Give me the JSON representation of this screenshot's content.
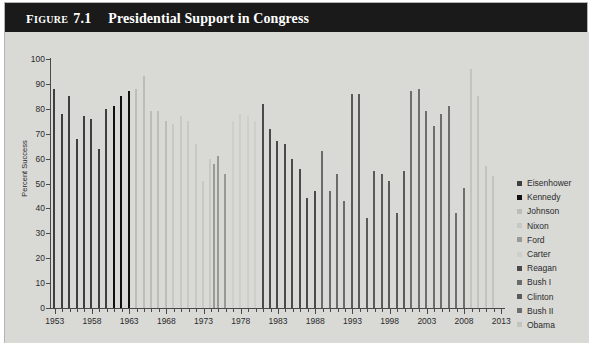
{
  "figure": {
    "label_prefix": "F",
    "label_rest": "IGURE",
    "number": "7.1",
    "title": "Presidential Support in Congress"
  },
  "chart_data": {
    "type": "bar",
    "title": "Presidential Support in Congress",
    "xlabel": "",
    "ylabel": "Percent Success",
    "ylim": [
      0,
      100
    ],
    "ytick_step": 10,
    "yticks": [
      0,
      10,
      20,
      30,
      40,
      50,
      60,
      70,
      80,
      90,
      100
    ],
    "grid": false,
    "legend_position": "right",
    "x_start_year": 1953,
    "x_end_year": 2013,
    "xticks_major": [
      1953,
      1958,
      1963,
      1968,
      1973,
      1978,
      1983,
      1988,
      1993,
      1998,
      2003,
      2008,
      2013
    ],
    "series": [
      {
        "name": "Eisenhower",
        "color": "#3f3f3f",
        "points": [
          {
            "x": 1953,
            "y": 88
          },
          {
            "x": 1954,
            "y": 78
          },
          {
            "x": 1955,
            "y": 85
          },
          {
            "x": 1956,
            "y": 68
          },
          {
            "x": 1957,
            "y": 77
          },
          {
            "x": 1958,
            "y": 76
          },
          {
            "x": 1959,
            "y": 64
          },
          {
            "x": 1960,
            "y": 80
          }
        ]
      },
      {
        "name": "Kennedy",
        "color": "#101010",
        "points": [
          {
            "x": 1961,
            "y": 81
          },
          {
            "x": 1962,
            "y": 85
          },
          {
            "x": 1963,
            "y": 87
          }
        ]
      },
      {
        "name": "Johnson",
        "color": "#bdbdb8",
        "points": [
          {
            "x": 1964,
            "y": 88
          },
          {
            "x": 1965,
            "y": 93
          },
          {
            "x": 1966,
            "y": 79
          },
          {
            "x": 1967,
            "y": 79
          },
          {
            "x": 1968,
            "y": 75
          }
        ]
      },
      {
        "name": "Nixon",
        "color": "#c9c9c4",
        "points": [
          {
            "x": 1969,
            "y": 74
          },
          {
            "x": 1970,
            "y": 77
          },
          {
            "x": 1971,
            "y": 75
          },
          {
            "x": 1972,
            "y": 66
          },
          {
            "x": 1973,
            "y": 51
          },
          {
            "x": 1974,
            "y": 60
          }
        ]
      },
      {
        "name": "Ford",
        "color": "#9a9a95",
        "points": [
          {
            "x": 1974,
            "y": 58
          },
          {
            "x": 1975,
            "y": 61
          },
          {
            "x": 1976,
            "y": 54
          }
        ]
      },
      {
        "name": "Carter",
        "color": "#cfcfca",
        "points": [
          {
            "x": 1977,
            "y": 75
          },
          {
            "x": 1978,
            "y": 78
          },
          {
            "x": 1979,
            "y": 77
          },
          {
            "x": 1980,
            "y": 75
          }
        ]
      },
      {
        "name": "Reagan",
        "color": "#4a4a4a",
        "points": [
          {
            "x": 1981,
            "y": 82
          },
          {
            "x": 1982,
            "y": 72
          },
          {
            "x": 1983,
            "y": 67
          },
          {
            "x": 1984,
            "y": 66
          },
          {
            "x": 1985,
            "y": 60
          },
          {
            "x": 1986,
            "y": 56
          },
          {
            "x": 1987,
            "y": 44
          },
          {
            "x": 1988,
            "y": 47
          }
        ]
      },
      {
        "name": "Bush I",
        "color": "#6b6b6b",
        "points": [
          {
            "x": 1989,
            "y": 63
          },
          {
            "x": 1990,
            "y": 47
          },
          {
            "x": 1991,
            "y": 54
          },
          {
            "x": 1992,
            "y": 43
          }
        ]
      },
      {
        "name": "Clinton",
        "color": "#5a5a5a",
        "points": [
          {
            "x": 1993,
            "y": 86
          },
          {
            "x": 1994,
            "y": 86
          },
          {
            "x": 1995,
            "y": 36
          },
          {
            "x": 1996,
            "y": 55
          },
          {
            "x": 1997,
            "y": 54
          },
          {
            "x": 1998,
            "y": 51
          },
          {
            "x": 1999,
            "y": 38
          },
          {
            "x": 2000,
            "y": 55
          }
        ]
      },
      {
        "name": "Bush II",
        "color": "#6e6e6e",
        "points": [
          {
            "x": 2001,
            "y": 87
          },
          {
            "x": 2002,
            "y": 88
          },
          {
            "x": 2003,
            "y": 79
          },
          {
            "x": 2004,
            "y": 73
          },
          {
            "x": 2005,
            "y": 78
          },
          {
            "x": 2006,
            "y": 81
          },
          {
            "x": 2007,
            "y": 38
          },
          {
            "x": 2008,
            "y": 48
          }
        ]
      },
      {
        "name": "Obama",
        "color": "#c4c4bf",
        "points": [
          {
            "x": 2009,
            "y": 96
          },
          {
            "x": 2010,
            "y": 85
          },
          {
            "x": 2011,
            "y": 57
          },
          {
            "x": 2012,
            "y": 53
          }
        ]
      }
    ]
  }
}
